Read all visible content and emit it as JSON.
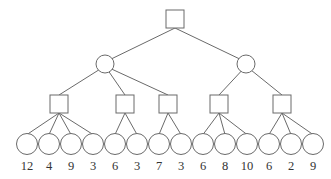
{
  "diagram": {
    "type": "game-tree",
    "root": {
      "shape": "square",
      "x": 175,
      "y": 19
    },
    "chance_nodes": [
      {
        "shape": "circle",
        "x": 105,
        "y": 64
      },
      {
        "shape": "circle",
        "x": 246,
        "y": 64
      }
    ],
    "max_nodes": [
      {
        "shape": "square",
        "x": 59,
        "y": 104,
        "parent": 0,
        "leaves": [
          0,
          1,
          2,
          3
        ]
      },
      {
        "shape": "square",
        "x": 125,
        "y": 104,
        "parent": 0,
        "leaves": [
          4,
          5
        ]
      },
      {
        "shape": "square",
        "x": 168,
        "y": 104,
        "parent": 0,
        "leaves": [
          6,
          7
        ]
      },
      {
        "shape": "square",
        "x": 219,
        "y": 104,
        "parent": 1,
        "leaves": [
          8,
          9,
          10
        ]
      },
      {
        "shape": "square",
        "x": 282,
        "y": 104,
        "parent": 1,
        "leaves": [
          11,
          12,
          13
        ]
      }
    ],
    "leaves": [
      {
        "label": "12",
        "x": 27
      },
      {
        "label": "4",
        "x": 49
      },
      {
        "label": "9",
        "x": 71
      },
      {
        "label": "3",
        "x": 93
      },
      {
        "label": "6",
        "x": 115
      },
      {
        "label": "3",
        "x": 137
      },
      {
        "label": "7",
        "x": 159
      },
      {
        "label": "3",
        "x": 181
      },
      {
        "label": "6",
        "x": 203
      },
      {
        "label": "8",
        "x": 225
      },
      {
        "label": "10",
        "x": 247
      },
      {
        "label": "6",
        "x": 269
      },
      {
        "label": "2",
        "x": 291
      },
      {
        "label": "9",
        "x": 313
      }
    ]
  }
}
